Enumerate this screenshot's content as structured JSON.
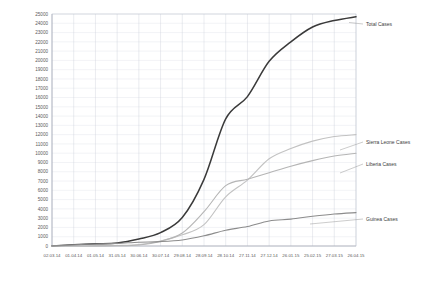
{
  "chart_data": {
    "type": "line",
    "title": "",
    "xlabel": "",
    "ylabel": "",
    "ylim": [
      0,
      25000
    ],
    "ytick_step": 1000,
    "yticks": [
      "0",
      "1000",
      "2000",
      "3000",
      "4000",
      "5000",
      "6000",
      "7000",
      "8000",
      "9000",
      "10000",
      "11000",
      "12000",
      "13000",
      "14000",
      "15000",
      "16000",
      "17000",
      "18000",
      "19000",
      "20000",
      "21000",
      "22000",
      "23000",
      "24000",
      "25000"
    ],
    "grid": true,
    "legend_position": "right-inline-labels",
    "x": [
      "02.03.14",
      "01.04.14",
      "01.05.14",
      "31.05.14",
      "30.06.14",
      "30.07.14",
      "29.08.14",
      "28.09.14",
      "28.10.14",
      "27.11.14",
      "27.12.14",
      "26.01.15",
      "25.02.15",
      "27.03.15",
      "26.04.15"
    ],
    "xticks": [
      "02.03.14",
      "01.04.14",
      "01.05.14",
      "31.05.14",
      "30.06.14",
      "30.07.14",
      "29.08.14",
      "28.09.14",
      "28.10.14",
      "27.11.14",
      "27.12.14",
      "26.01.15",
      "25.02.15",
      "27.03.15",
      "26.04.15"
    ],
    "series": [
      {
        "name": "Total Cases",
        "color": "#3a3a3a",
        "width": 1.5,
        "values": [
          10,
          130,
          230,
          330,
          760,
          1440,
          3070,
          7180,
          13700,
          16100,
          19900,
          22000,
          23600,
          24300,
          24700
        ]
      },
      {
        "name": "Sierra Leone Cases",
        "color": "#c2c2c2",
        "width": 1.1,
        "values": [
          0,
          0,
          0,
          50,
          160,
          540,
          1200,
          2300,
          5300,
          7100,
          9400,
          10500,
          11300,
          11800,
          12000
        ]
      },
      {
        "name": "Liberia Cases",
        "color": "#b5b5b5",
        "width": 1.1,
        "values": [
          0,
          0,
          10,
          20,
          110,
          520,
          1400,
          3700,
          6500,
          7200,
          7900,
          8600,
          9200,
          9700,
          10000
        ]
      },
      {
        "name": "Guinea Cases",
        "color": "#8c8c8c",
        "width": 1.1,
        "values": [
          10,
          130,
          220,
          280,
          410,
          470,
          650,
          1100,
          1700,
          2100,
          2700,
          2900,
          3200,
          3450,
          3600
        ]
      }
    ],
    "series_labels": [
      {
        "name": "Total Cases",
        "label": "Total Cases"
      },
      {
        "name": "Sierra Leone Cases",
        "label": "Sierra Leone Cases"
      },
      {
        "name": "Liberia Cases",
        "label": "Liberia Cases"
      },
      {
        "name": "Guinea Cases",
        "label": "Guinea Cases"
      }
    ]
  }
}
